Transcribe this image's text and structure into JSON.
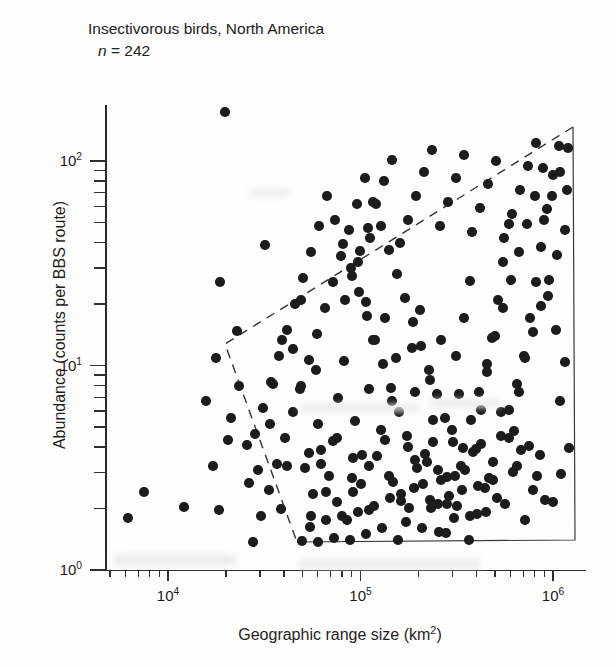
{
  "figure": {
    "title": "Insectivorous birds, North America",
    "sample_label_italic": "n",
    "sample_label_rest": " = 242"
  },
  "chart_data": {
    "type": "scatter",
    "title": "Insectivorous birds, North America",
    "annotation": "n = 242",
    "n": 242,
    "xlabel": "Geographic range size (km2)",
    "xlabel_base": "Geographic range size (km",
    "xlabel_sup": "2",
    "xlabel_tail": ")",
    "ylabel": "Abundance (counts per BBS route)",
    "xscale": "log",
    "yscale": "log",
    "xlim": [
      4000,
      1500000
    ],
    "ylim": [
      1,
      250
    ],
    "grid": false,
    "legend": null,
    "xticks": [
      {
        "value": 10000,
        "label_base": "10",
        "label_sup": "4"
      },
      {
        "value": 100000,
        "label_base": "10",
        "label_sup": "5"
      },
      {
        "value": 1000000,
        "label_base": "10",
        "label_sup": "6"
      }
    ],
    "yticks": [
      {
        "value": 1,
        "label_base": "10",
        "label_sup": "0"
      },
      {
        "value": 10,
        "label_base": "10",
        "label_sup": "1"
      },
      {
        "value": 100,
        "label_base": "10",
        "label_sup": "2"
      }
    ],
    "marker": {
      "shape": "circle",
      "color": "#1c1c1c",
      "size_px": 9.5,
      "filled": true
    },
    "constraint_boundary": {
      "style": "dashed-and-solid-polygon",
      "description": "Dashed upper-left constraint envelope closed by solid right and bottom edges",
      "vertices_px": [
        [
          573,
          127
        ],
        [
          225,
          344
        ],
        [
          297,
          542
        ],
        [
          575,
          540
        ]
      ],
      "dashed_edges": [
        [
          0,
          1
        ],
        [
          1,
          2
        ]
      ],
      "solid_edges": [
        [
          2,
          3
        ],
        [
          3,
          0
        ]
      ]
    },
    "points_px": [
      [
        225,
        112
      ],
      [
        128,
        518
      ],
      [
        144,
        492
      ],
      [
        184,
        507
      ],
      [
        213,
        466
      ],
      [
        219,
        510
      ],
      [
        206,
        401
      ],
      [
        216,
        358
      ],
      [
        231,
        418
      ],
      [
        239,
        386
      ],
      [
        228,
        440
      ],
      [
        247,
        445
      ],
      [
        249,
        483
      ],
      [
        220,
        282
      ],
      [
        265,
        245
      ],
      [
        237,
        331
      ],
      [
        258,
        470
      ],
      [
        270,
        424
      ],
      [
        281,
        509
      ],
      [
        287,
        466
      ],
      [
        293,
        349
      ],
      [
        300,
        389
      ],
      [
        301,
        300
      ],
      [
        273,
        384
      ],
      [
        282,
        340
      ],
      [
        309,
        453
      ],
      [
        318,
        424
      ],
      [
        316,
        370
      ],
      [
        326,
        492
      ],
      [
        333,
        441
      ],
      [
        311,
        516
      ],
      [
        338,
        398
      ],
      [
        344,
        361
      ],
      [
        352,
        478
      ],
      [
        355,
        421
      ],
      [
        347,
        520
      ],
      [
        362,
        455
      ],
      [
        369,
        389
      ],
      [
        373,
        340
      ],
      [
        366,
        302
      ],
      [
        358,
        262
      ],
      [
        370,
        238
      ],
      [
        381,
        430
      ],
      [
        389,
        476
      ],
      [
        392,
        401
      ],
      [
        396,
        358
      ],
      [
        385,
        318
      ],
      [
        401,
        501
      ],
      [
        408,
        447
      ],
      [
        415,
        392
      ],
      [
        412,
        348
      ],
      [
        420,
        310
      ],
      [
        427,
        462
      ],
      [
        433,
        420
      ],
      [
        430,
        380
      ],
      [
        441,
        340
      ],
      [
        438,
        504
      ],
      [
        447,
        477
      ],
      [
        452,
        430
      ],
      [
        459,
        394
      ],
      [
        456,
        356
      ],
      [
        464,
        318
      ],
      [
        470,
        281
      ],
      [
        476,
        449
      ],
      [
        481,
        410
      ],
      [
        487,
        372
      ],
      [
        492,
        338
      ],
      [
        498,
        300
      ],
      [
        503,
        262
      ],
      [
        509,
        224
      ],
      [
        514,
        431
      ],
      [
        519,
        392
      ],
      [
        524,
        356
      ],
      [
        530,
        318
      ],
      [
        536,
        282
      ],
      [
        541,
        247
      ],
      [
        547,
        209
      ],
      [
        553,
        175
      ],
      [
        560,
        401
      ],
      [
        565,
        362
      ],
      [
        556,
        330
      ],
      [
        548,
        296
      ],
      [
        540,
        455
      ],
      [
        533,
        490
      ],
      [
        525,
        520
      ],
      [
        517,
        466
      ],
      [
        509,
        438
      ],
      [
        501,
        412
      ],
      [
        493,
        480
      ],
      [
        486,
        512
      ],
      [
        478,
        486
      ],
      [
        470,
        516
      ],
      [
        462,
        490
      ],
      [
        454,
        518
      ],
      [
        446,
        533
      ],
      [
        438,
        470
      ],
      [
        430,
        500
      ],
      [
        422,
        528
      ],
      [
        414,
        488
      ],
      [
        406,
        522
      ],
      [
        398,
        540
      ],
      [
        390,
        498
      ],
      [
        382,
        528
      ],
      [
        374,
        506
      ],
      [
        366,
        534
      ],
      [
        358,
        512
      ],
      [
        350,
        540
      ],
      [
        342,
        516
      ],
      [
        334,
        538
      ],
      [
        326,
        520
      ],
      [
        318,
        542
      ],
      [
        310,
        527
      ],
      [
        302,
        541
      ],
      [
        345,
        300
      ],
      [
        352,
        276
      ],
      [
        360,
        251
      ],
      [
        368,
        228
      ],
      [
        376,
        204
      ],
      [
        384,
        181
      ],
      [
        392,
        160
      ],
      [
        400,
        243
      ],
      [
        408,
        220
      ],
      [
        416,
        196
      ],
      [
        424,
        172
      ],
      [
        432,
        150
      ],
      [
        440,
        226
      ],
      [
        448,
        202
      ],
      [
        456,
        178
      ],
      [
        464,
        155
      ],
      [
        472,
        232
      ],
      [
        480,
        208
      ],
      [
        488,
        184
      ],
      [
        496,
        161
      ],
      [
        504,
        238
      ],
      [
        512,
        214
      ],
      [
        520,
        190
      ],
      [
        528,
        166
      ],
      [
        536,
        143
      ],
      [
        544,
        220
      ],
      [
        552,
        196
      ],
      [
        560,
        172
      ],
      [
        568,
        148
      ],
      [
        565,
        230
      ],
      [
        557,
        255
      ],
      [
        549,
        280
      ],
      [
        541,
        306
      ],
      [
        533,
        332
      ],
      [
        525,
        358
      ],
      [
        517,
        384
      ],
      [
        509,
        410
      ],
      [
        501,
        436
      ],
      [
        493,
        462
      ],
      [
        485,
        488
      ],
      [
        477,
        514
      ],
      [
        469,
        540
      ],
      [
        461,
        466
      ],
      [
        453,
        442
      ],
      [
        445,
        418
      ],
      [
        437,
        394
      ],
      [
        429,
        370
      ],
      [
        421,
        346
      ],
      [
        413,
        322
      ],
      [
        405,
        298
      ],
      [
        397,
        274
      ],
      [
        389,
        250
      ],
      [
        381,
        226
      ],
      [
        373,
        202
      ],
      [
        365,
        178
      ],
      [
        357,
        204
      ],
      [
        349,
        230
      ],
      [
        341,
        256
      ],
      [
        333,
        282
      ],
      [
        325,
        308
      ],
      [
        317,
        334
      ],
      [
        309,
        360
      ],
      [
        301,
        386
      ],
      [
        293,
        412
      ],
      [
        285,
        438
      ],
      [
        277,
        464
      ],
      [
        269,
        490
      ],
      [
        261,
        516
      ],
      [
        253,
        542
      ],
      [
        305,
        468
      ],
      [
        313,
        494
      ],
      [
        321,
        450
      ],
      [
        329,
        476
      ],
      [
        337,
        502
      ],
      [
        353,
        458
      ],
      [
        361,
        484
      ],
      [
        369,
        510
      ],
      [
        377,
        456
      ],
      [
        393,
        482
      ],
      [
        409,
        508
      ],
      [
        425,
        454
      ],
      [
        441,
        480
      ],
      [
        457,
        506
      ],
      [
        473,
        452
      ],
      [
        489,
        478
      ],
      [
        505,
        504
      ],
      [
        521,
        450
      ],
      [
        537,
        476
      ],
      [
        553,
        502
      ],
      [
        569,
        448
      ],
      [
        561,
        474
      ],
      [
        545,
        500
      ],
      [
        529,
        446
      ],
      [
        513,
        472
      ],
      [
        497,
        498
      ],
      [
        481,
        444
      ],
      [
        465,
        470
      ],
      [
        449,
        496
      ],
      [
        433,
        442
      ],
      [
        417,
        468
      ],
      [
        401,
        494
      ],
      [
        385,
        440
      ],
      [
        369,
        466
      ],
      [
        353,
        492
      ],
      [
        337,
        438
      ],
      [
        321,
        464
      ],
      [
        567,
        190
      ],
      [
        559,
        146
      ],
      [
        543,
        168
      ],
      [
        535,
        196
      ],
      [
        527,
        224
      ],
      [
        519,
        252
      ],
      [
        511,
        280
      ],
      [
        503,
        308
      ],
      [
        495,
        336
      ],
      [
        487,
        364
      ],
      [
        479,
        392
      ],
      [
        471,
        420
      ],
      [
        463,
        448
      ],
      [
        455,
        476
      ],
      [
        447,
        504
      ],
      [
        439,
        532
      ],
      [
        431,
        508
      ],
      [
        423,
        484
      ],
      [
        415,
        460
      ],
      [
        407,
        436
      ],
      [
        399,
        412
      ],
      [
        391,
        388
      ],
      [
        383,
        364
      ],
      [
        375,
        340
      ],
      [
        367,
        316
      ],
      [
        359,
        292
      ],
      [
        351,
        268
      ],
      [
        343,
        244
      ],
      [
        335,
        220
      ],
      [
        327,
        196
      ],
      [
        319,
        226
      ],
      [
        311,
        252
      ],
      [
        303,
        278
      ],
      [
        295,
        304
      ],
      [
        287,
        330
      ],
      [
        279,
        356
      ],
      [
        271,
        382
      ],
      [
        263,
        408
      ],
      [
        255,
        434
      ]
    ]
  },
  "icons": {
    "marker": "filled-circle-marker",
    "boundary": "dashed-constraint-polygon"
  }
}
